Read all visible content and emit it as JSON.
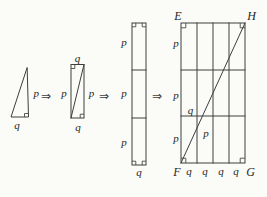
{
  "colors": {
    "background": "#fbfbf8",
    "line": "#3e3e3e",
    "text": "#262626"
  },
  "triangle": {
    "side_label": "p",
    "base_label": "q"
  },
  "small_rect": {
    "top_label": "q",
    "left_label": "p",
    "right_label": "p",
    "bottom_label": "q"
  },
  "strip": {
    "section_labels": [
      "p",
      "p",
      "p"
    ],
    "bottom_label": "q"
  },
  "grid": {
    "corner_top_left": "E",
    "corner_top_right": "H",
    "corner_bottom_left": "F",
    "corner_bottom_right": "G",
    "row_labels": [
      "p",
      "p",
      "p"
    ],
    "column_labels": [
      "q",
      "q",
      "q",
      "q"
    ],
    "diagonal_run_label": "q",
    "diagonal_rise_label": "p"
  },
  "arrow_glyph": "⇒"
}
